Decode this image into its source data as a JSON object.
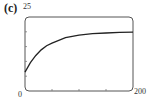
{
  "panel_label": "(c)",
  "axes": {
    "y_max_label": "25",
    "x_min_label": "0",
    "x_max_label": "200"
  },
  "chart_data": {
    "type": "line",
    "title": "",
    "xlabel": "",
    "ylabel": "",
    "xlim": [
      0,
      200
    ],
    "ylim": [
      0,
      25
    ],
    "x_ticks": [
      0,
      50,
      100,
      150,
      200
    ],
    "y_ticks": [
      0,
      5,
      10,
      15,
      20,
      25
    ],
    "grid": false,
    "legend": null,
    "series": [
      {
        "name": "curve",
        "x": [
          0,
          10,
          20,
          30,
          40,
          50,
          75,
          100,
          125,
          150,
          175,
          200
        ],
        "values": [
          6.4,
          9.6,
          12.0,
          13.9,
          15.3,
          16.2,
          18.0,
          18.9,
          19.4,
          19.6,
          19.8,
          19.9
        ]
      }
    ]
  }
}
